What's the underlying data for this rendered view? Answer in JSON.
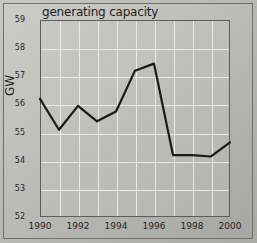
{
  "chart_data": {
    "type": "line",
    "title": "generating capacity",
    "xlabel": "",
    "ylabel": "GW",
    "x": [
      1990,
      1991,
      1992,
      1993,
      1994,
      1995,
      1996,
      1997,
      1998,
      1999,
      2000
    ],
    "values": [
      56.2,
      55.1,
      55.95,
      55.4,
      55.75,
      57.2,
      57.45,
      54.2,
      54.2,
      54.15,
      54.65
    ],
    "series": [
      {
        "name": "generating capacity",
        "values": [
          56.2,
          55.1,
          55.95,
          55.4,
          55.75,
          57.2,
          57.45,
          54.2,
          54.2,
          54.15,
          54.65
        ]
      }
    ],
    "xlim": [
      1990,
      2000
    ],
    "ylim": [
      52,
      59
    ],
    "x_ticks": [
      1990,
      1991,
      1992,
      1993,
      1994,
      1995,
      1996,
      1997,
      1998,
      1999,
      2000
    ],
    "x_tick_labels": [
      "1990",
      "",
      "1992",
      "",
      "1994",
      "",
      "1996",
      "",
      "1998",
      "",
      "2000"
    ],
    "y_ticks": [
      52,
      53,
      54,
      55,
      56,
      57,
      58,
      59
    ],
    "y_tick_labels": [
      "52",
      "53",
      "54",
      "55",
      "56",
      "57",
      "58",
      "59"
    ],
    "grid": true,
    "legend": false,
    "line_color": "#1a1a1a",
    "grid_color": "#e9e9e6",
    "axis_color": "#5d5d5a",
    "background_color": "#bdbdb9"
  }
}
